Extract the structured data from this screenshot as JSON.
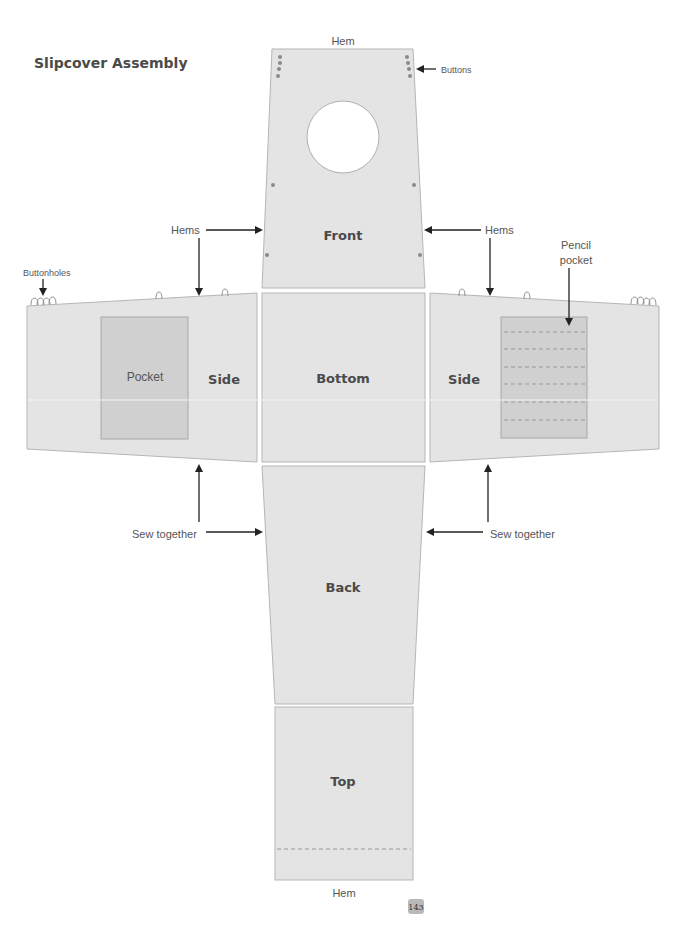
{
  "title": "Slipcover Assembly",
  "page_number": "143",
  "panels": {
    "front": {
      "label": "Front"
    },
    "bottom": {
      "label": "Bottom"
    },
    "side_left": {
      "label": "Side"
    },
    "side_right": {
      "label": "Side"
    },
    "back": {
      "label": "Back"
    },
    "top": {
      "label": "Top"
    }
  },
  "pockets": {
    "left": {
      "label": "Pocket"
    },
    "right": {
      "label": ""
    }
  },
  "callouts": {
    "hem_top": "Hem",
    "hem_bottom": "Hem",
    "buttons": "Buttons",
    "hems_left": "Hems",
    "hems_right": "Hems",
    "buttonholes": "Buttonholes",
    "pencil_pocket_line1": "Pencil",
    "pencil_pocket_line2": "pocket",
    "sew_together_left": "Sew together",
    "sew_together_right": "Sew together"
  },
  "colors": {
    "panel_fill": "#e4e4e4",
    "panel_stroke": "#b5b5b5",
    "pocket_fill": "#d0d0d0",
    "text": "#4a4a4a",
    "arrow": "#222222",
    "dot": "#8a8a8a"
  }
}
